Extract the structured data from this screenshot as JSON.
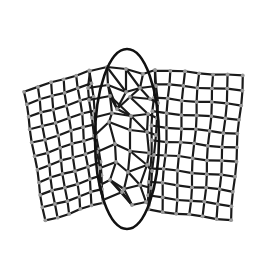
{
  "diagram": {
    "type": "deformed-mesh",
    "colors": {
      "background": "#ffffff",
      "edge": "#1a1a1a",
      "node": "#9a9a9a",
      "ellipse": "#111111"
    },
    "left_grid": {
      "rows": 10,
      "cols": 5,
      "top_left": [
        24,
        91
      ],
      "top_right": [
        90,
        71
      ],
      "bottom_left": [
        45,
        221
      ],
      "bottom_right": [
        104,
        202
      ]
    },
    "right_grid": {
      "rows": 10,
      "cols": 6,
      "top_left": [
        155,
        70
      ],
      "top_right": [
        243,
        76
      ],
      "bottom_left": [
        148,
        210
      ],
      "bottom_right": [
        231,
        220
      ]
    },
    "distorted_region": {
      "nodes": [
        [
          90,
          71
        ],
        [
          107,
          67
        ],
        [
          126,
          69
        ],
        [
          143,
          74
        ],
        [
          155,
          70
        ],
        [
          88,
          88
        ],
        [
          108,
          85
        ],
        [
          126,
          92
        ],
        [
          140,
          88
        ],
        [
          156,
          86
        ],
        [
          89,
          100
        ],
        [
          110,
          96
        ],
        [
          117,
          109
        ],
        [
          130,
          97
        ],
        [
          150,
          99
        ],
        [
          158,
          103
        ],
        [
          92,
          118
        ],
        [
          112,
          113
        ],
        [
          131,
          116
        ],
        [
          148,
          114
        ],
        [
          157,
          118
        ],
        [
          94,
          136
        ],
        [
          109,
          122
        ],
        [
          130,
          130
        ],
        [
          147,
          132
        ],
        [
          156,
          135
        ],
        [
          97,
          152
        ],
        [
          115,
          144
        ],
        [
          130,
          151
        ],
        [
          149,
          153
        ],
        [
          154,
          155
        ],
        [
          100,
          168
        ],
        [
          116,
          162
        ],
        [
          128,
          172
        ],
        [
          147,
          165
        ],
        [
          152,
          171
        ],
        [
          100,
          185
        ],
        [
          110,
          180
        ],
        [
          124,
          189
        ],
        [
          140,
          185
        ],
        [
          151,
          188
        ],
        [
          103,
          200
        ],
        [
          122,
          192
        ],
        [
          132,
          205
        ],
        [
          146,
          202
        ],
        [
          149,
          205
        ]
      ],
      "edges": [
        [
          0,
          1
        ],
        [
          1,
          2
        ],
        [
          2,
          3
        ],
        [
          3,
          4
        ],
        [
          5,
          6
        ],
        [
          6,
          7
        ],
        [
          7,
          8
        ],
        [
          8,
          9
        ],
        [
          10,
          11
        ],
        [
          11,
          12
        ],
        [
          12,
          13
        ],
        [
          13,
          14
        ],
        [
          14,
          15
        ],
        [
          16,
          17
        ],
        [
          17,
          18
        ],
        [
          18,
          19
        ],
        [
          19,
          20
        ],
        [
          21,
          22
        ],
        [
          22,
          23
        ],
        [
          23,
          24
        ],
        [
          24,
          25
        ],
        [
          26,
          27
        ],
        [
          27,
          28
        ],
        [
          28,
          29
        ],
        [
          29,
          30
        ],
        [
          31,
          32
        ],
        [
          32,
          33
        ],
        [
          33,
          34
        ],
        [
          34,
          35
        ],
        [
          36,
          37
        ],
        [
          37,
          38
        ],
        [
          38,
          39
        ],
        [
          39,
          40
        ],
        [
          41,
          42
        ],
        [
          42,
          43
        ],
        [
          43,
          44
        ],
        [
          44,
          45
        ],
        [
          0,
          5
        ],
        [
          5,
          10
        ],
        [
          10,
          16
        ],
        [
          16,
          21
        ],
        [
          21,
          26
        ],
        [
          26,
          31
        ],
        [
          31,
          36
        ],
        [
          36,
          41
        ],
        [
          1,
          6
        ],
        [
          6,
          11
        ],
        [
          11,
          17
        ],
        [
          17,
          22
        ],
        [
          22,
          27
        ],
        [
          27,
          32
        ],
        [
          32,
          37
        ],
        [
          37,
          42
        ],
        [
          2,
          7
        ],
        [
          7,
          12
        ],
        [
          12,
          18
        ],
        [
          18,
          23
        ],
        [
          23,
          28
        ],
        [
          28,
          33
        ],
        [
          33,
          38
        ],
        [
          38,
          43
        ],
        [
          3,
          8
        ],
        [
          8,
          13
        ],
        [
          13,
          19
        ],
        [
          19,
          24
        ],
        [
          24,
          29
        ],
        [
          29,
          34
        ],
        [
          34,
          39
        ],
        [
          39,
          44
        ],
        [
          4,
          9
        ],
        [
          9,
          15
        ],
        [
          15,
          20
        ],
        [
          20,
          25
        ],
        [
          25,
          30
        ],
        [
          30,
          35
        ],
        [
          35,
          40
        ],
        [
          40,
          45
        ],
        [
          1,
          7
        ],
        [
          2,
          8
        ],
        [
          6,
          12
        ],
        [
          8,
          14
        ],
        [
          11,
          18
        ],
        [
          18,
          24
        ],
        [
          28,
          34
        ],
        [
          33,
          39
        ],
        [
          37,
          43
        ]
      ]
    },
    "ellipse": {
      "cx": 127,
      "cy": 139,
      "rx": 32,
      "ry": 90
    }
  }
}
